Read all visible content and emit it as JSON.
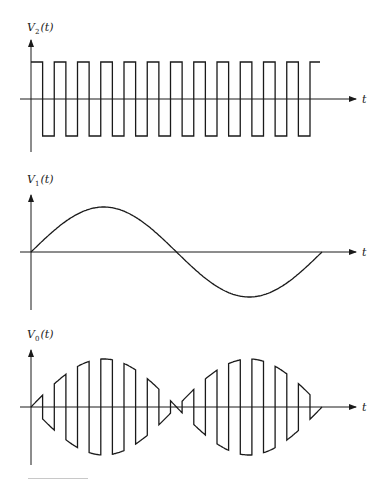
{
  "chart_data": [
    {
      "type": "line",
      "title": "",
      "ylabel": "V2(t)",
      "xlabel": "t",
      "waveform": "square",
      "cycles": 12,
      "amplitude": 1,
      "starts_high": true,
      "grid": false,
      "legend": false
    },
    {
      "type": "line",
      "title": "",
      "ylabel": "V1(t)",
      "xlabel": "t",
      "waveform": "sine",
      "cycles": 1,
      "amplitude": 1,
      "grid": false,
      "legend": false
    },
    {
      "type": "line",
      "title": "",
      "ylabel": "V0(t)",
      "xlabel": "t",
      "waveform": "product V1(t)·V2(t)",
      "cycles": 12,
      "amplitude": 1,
      "grid": false,
      "legend": false
    }
  ],
  "panels": [
    {
      "ylabel_main": "V",
      "ylabel_sub": "2",
      "ylabel_arg": "(t)",
      "xlabel": "t"
    },
    {
      "ylabel_main": "V",
      "ylabel_sub": "1",
      "ylabel_arg": "(t)",
      "xlabel": "t"
    },
    {
      "ylabel_main": "V",
      "ylabel_sub": "0",
      "ylabel_arg": "(t)",
      "xlabel": "t"
    }
  ],
  "colors": {
    "stroke": "#1a1a1a",
    "background": "#ffffff"
  }
}
